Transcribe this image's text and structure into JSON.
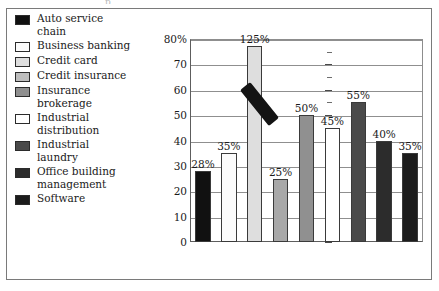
{
  "artifact": {
    "top_text": "p"
  },
  "chart_data": {
    "type": "bar",
    "title": "",
    "subtitle": "",
    "xlabel": "",
    "ylabel": "",
    "ylim": [
      0,
      80
    ],
    "y_unit": "%",
    "grid": true,
    "legend_position": "left",
    "axis_break_note": "125% bar exceeds the 80% axis maximum; a diagonal break marker is drawn across it",
    "y_ticks": [
      {
        "value": 80,
        "label": "80%"
      },
      {
        "value": 70,
        "label": "70"
      },
      {
        "value": 60,
        "label": "60"
      },
      {
        "value": 50,
        "label": "50"
      },
      {
        "value": 40,
        "label": "40"
      },
      {
        "value": 30,
        "label": "30"
      },
      {
        "value": 20,
        "label": "20"
      },
      {
        "value": 10,
        "label": "10"
      },
      {
        "value": 0,
        "label": "0"
      }
    ],
    "categories": [
      "Auto service chain",
      "Business banking",
      "Credit card",
      "Credit insurance",
      "Insurance brokerage",
      "Industrial distribution",
      "Industrial laundry",
      "Office building management",
      "Software"
    ],
    "values": [
      28,
      35,
      125,
      25,
      50,
      45,
      55,
      40,
      35
    ],
    "data_labels": [
      "28%",
      "35%",
      "125%",
      "25%",
      "50%",
      "45%",
      "55%",
      "40%",
      "35%"
    ],
    "colors": [
      "#111111",
      "#fbfbfb",
      "#dedede",
      "#a8a8a8",
      "#909090",
      "#ffffff",
      "#4a4a4a",
      "#2c2c2c",
      "#1c1c1c"
    ]
  },
  "legend": {
    "items": [
      {
        "label": "Auto service\nchain",
        "color": "#111111"
      },
      {
        "label": "Business banking",
        "color": "#fbfbfb"
      },
      {
        "label": "Credit card",
        "color": "#dedede"
      },
      {
        "label": "Credit insurance",
        "color": "#bdbdbd"
      },
      {
        "label": "Insurance\nbrokerage",
        "color": "#8f8f8f"
      },
      {
        "label": "Industrial\ndistribution",
        "color": "#ffffff"
      },
      {
        "label": "Industrial\nlaundry",
        "color": "#4a4a4a"
      },
      {
        "label": "Office building\nmanagement",
        "color": "#2c2c2c"
      },
      {
        "label": "Software",
        "color": "#1c1c1c"
      }
    ]
  }
}
